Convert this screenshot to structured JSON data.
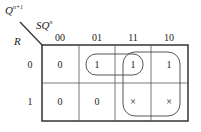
{
  "kmap": {
    "output_label": "Q",
    "output_sup": "n+1",
    "col_var_label": "SQ",
    "col_var_sup": "n",
    "row_var_label": "R",
    "col_headers": [
      "00",
      "01",
      "11",
      "10"
    ],
    "row_headers": [
      "0",
      "1"
    ],
    "cells": [
      [
        "0",
        "1",
        "1",
        "1"
      ],
      [
        "0",
        "0",
        "×",
        "×"
      ]
    ],
    "groupings": [
      {
        "name": "group-row0-cols-01-11",
        "cells": [
          [
            0,
            1
          ],
          [
            0,
            2
          ]
        ]
      },
      {
        "name": "group-cols-11-10",
        "cells": [
          [
            0,
            2
          ],
          [
            0,
            3
          ],
          [
            1,
            2
          ],
          [
            1,
            3
          ]
        ]
      }
    ],
    "line_color": "#333333"
  }
}
